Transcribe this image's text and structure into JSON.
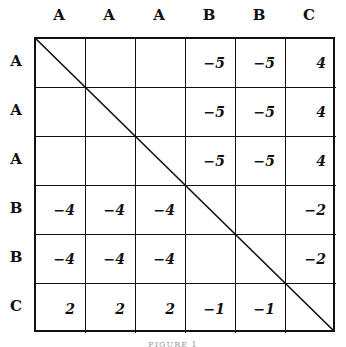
{
  "matrix": {
    "col_headers": [
      "A",
      "A",
      "A",
      "B",
      "B",
      "C"
    ],
    "row_headers": [
      "A",
      "A",
      "A",
      "B",
      "B",
      "C"
    ],
    "rows": [
      [
        "",
        "",
        "",
        "−5",
        "−5",
        "4"
      ],
      [
        "",
        "",
        "",
        "−5",
        "−5",
        "4"
      ],
      [
        "",
        "",
        "",
        "−5",
        "−5",
        "4"
      ],
      [
        "−4",
        "−4",
        "−4",
        "",
        "",
        "−2"
      ],
      [
        "−4",
        "−4",
        "−4",
        "",
        "",
        "−2"
      ],
      [
        "2",
        "2",
        "2",
        "−1",
        "−1",
        ""
      ]
    ],
    "diagonal_line": true
  },
  "caption": "FIGURE 1"
}
